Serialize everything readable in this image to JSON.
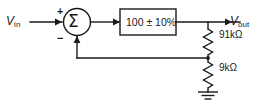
{
  "diagram": {
    "signals": {
      "input_label": "V",
      "input_subscript": "in",
      "output_label": "V",
      "output_subscript": "out"
    },
    "summing_junction": {
      "symbol": "Σ",
      "positive_sign": "+",
      "negative_sign": "−"
    },
    "gain_block": {
      "label": "100 ± 10%"
    },
    "resistors": [
      {
        "label": "91kΩ"
      },
      {
        "label": "9kΩ"
      }
    ],
    "colors": {
      "line": "#1a1a1a",
      "background": "#ffffff"
    }
  }
}
